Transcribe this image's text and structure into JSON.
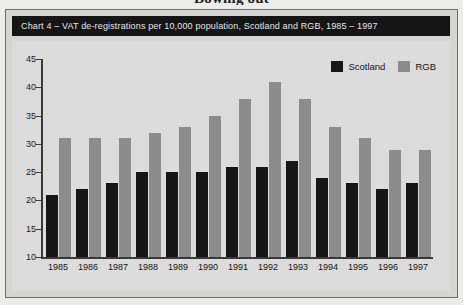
{
  "page": {
    "headline": "Bowing out"
  },
  "chart_banner": {
    "text": "Chart 4 – VAT de-registrations per 10,000 population, Scotland and RGB, 1985 – 1997"
  },
  "legend": {
    "entries": [
      {
        "label": "Scotland",
        "color": "#161616",
        "swatch_name": "legend-swatch-scotland"
      },
      {
        "label": "RGB",
        "color": "#8c8c8c",
        "swatch_name": "legend-swatch-rgb"
      }
    ]
  },
  "colors": {
    "scotland": "#161616",
    "rgb": "#8c8c8c",
    "plot_background": "#dcdcdc",
    "frame_background": "#d5d5d5",
    "banner_background": "#151515",
    "banner_text": "#e6e6e6",
    "axis": "#3a3a3a"
  },
  "chart_data": {
    "type": "bar",
    "title": "Chart 4 – VAT de-registrations per 10,000 population, Scotland and RGB, 1985 – 1997",
    "xlabel": "",
    "ylabel": "",
    "ylim": [
      10,
      45
    ],
    "yticks": [
      10,
      15,
      20,
      25,
      30,
      35,
      40,
      45
    ],
    "ytick_labels": [
      "10",
      "15",
      "20",
      "25",
      "30",
      "35",
      "40",
      "45"
    ],
    "grid": false,
    "legend_position": "top-right",
    "categories": [
      "1985",
      "1986",
      "1987",
      "1988",
      "1989",
      "1990",
      "1991",
      "1992",
      "1993",
      "1994",
      "1995",
      "1996",
      "1997"
    ],
    "series": [
      {
        "name": "Scotland",
        "color": "#161616",
        "values": [
          21,
          22,
          23,
          25,
          25,
          25,
          26,
          26,
          27,
          24,
          23,
          22,
          23
        ]
      },
      {
        "name": "RGB",
        "color": "#8c8c8c",
        "values": [
          31,
          31,
          31,
          32,
          33,
          35,
          38,
          41,
          38,
          33,
          31,
          29,
          29
        ]
      }
    ]
  }
}
